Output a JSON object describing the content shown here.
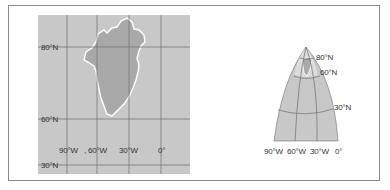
{
  "figure": {
    "left_panel": {
      "projection": "cylindrical",
      "lat_labels": [
        "80°N",
        "60°N",
        "30°N"
      ],
      "lon_labels": [
        "90°W",
        ", 60°W",
        "30°W",
        "0°"
      ],
      "feature": "Greenland"
    },
    "right_panel": {
      "projection": "conic",
      "lat_labels": [
        "80°N",
        "60°N",
        "30°N"
      ],
      "lon_labels": [
        "90°W",
        "60°W",
        "30°W",
        "0°"
      ],
      "feature": "Greenland"
    },
    "colors": {
      "map_fill": "#c8c8c8",
      "land_fill": "#a9a9a9",
      "coast": "#ffffff",
      "grid": "#6e6e6e",
      "frame": "#8a8a8a"
    }
  }
}
